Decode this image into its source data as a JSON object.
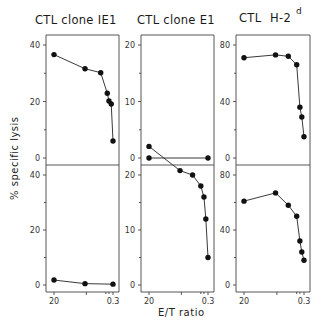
{
  "chart_data": {
    "type": "line",
    "ylabel": "% specific lysis",
    "xlabel": "E/T ratio",
    "xscale": "log",
    "x_tick_labels": [
      "20",
      "0.3"
    ],
    "layout": "2 rows x 3 columns of small-multiple panels",
    "panels": [
      {
        "row": 0,
        "col": 0,
        "title": "CTL clone IE1",
        "ylim": [
          0,
          40
        ],
        "y_ticks": [
          0,
          20,
          40
        ],
        "x": [
          20,
          2.2,
          0.72,
          0.45,
          0.4,
          0.34,
          0.3
        ],
        "values": [
          36.6,
          31.6,
          30.2,
          22.9,
          20.2,
          19.1,
          6.0
        ]
      },
      {
        "row": 0,
        "col": 1,
        "title": "CTL clone E1",
        "ylim": [
          0,
          25
        ],
        "y_ticks": [
          0,
          10,
          20
        ],
        "x": [
          20,
          0.3
        ],
        "values": [
          0,
          0
        ]
      },
      {
        "row": 0,
        "col": 2,
        "title": "CTL anti H-2d",
        "title_main": "CTL",
        "title_suffix": "H-2",
        "title_superscript": "d",
        "ylim": [
          0,
          80
        ],
        "y_ticks": [
          0,
          40,
          80
        ],
        "x": [
          20,
          2.2,
          0.9,
          0.5,
          0.4,
          0.35,
          0.3
        ],
        "values": [
          71,
          73,
          72,
          66,
          36,
          29,
          15
        ]
      },
      {
        "row": 1,
        "col": 0,
        "title": "",
        "ylim": [
          0,
          40
        ],
        "y_ticks": [
          0,
          20,
          40
        ],
        "x": [
          20,
          2.2,
          0.3
        ],
        "values": [
          1.8,
          0.5,
          0.3
        ]
      },
      {
        "row": 1,
        "col": 1,
        "title": "",
        "ylim": [
          0,
          25
        ],
        "y_ticks": [
          0,
          10,
          20
        ],
        "x": [
          20,
          2.2,
          0.9,
          0.5,
          0.4,
          0.35,
          0.3
        ],
        "values": [
          25.2,
          20.8,
          20.0,
          18.0,
          16.0,
          12.0,
          5.0
        ]
      },
      {
        "row": 1,
        "col": 2,
        "title": "",
        "ylim": [
          0,
          80
        ],
        "y_ticks": [
          0,
          40,
          80
        ],
        "x": [
          20,
          2.2,
          0.9,
          0.5,
          0.4,
          0.35,
          0.3
        ],
        "values": [
          61,
          67,
          58,
          50,
          32,
          24,
          18
        ]
      }
    ]
  }
}
